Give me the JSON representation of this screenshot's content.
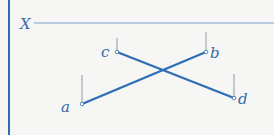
{
  "diagram": {
    "axis_label": "X",
    "points": [
      {
        "label": "a",
        "x": 82,
        "y": 104,
        "tick_top": 75
      },
      {
        "label": "b",
        "x": 206,
        "y": 52,
        "tick_top": 32
      },
      {
        "label": "c",
        "x": 117,
        "y": 52,
        "tick_top": 38
      },
      {
        "label": "d",
        "x": 234,
        "y": 98,
        "tick_top": 74
      }
    ],
    "segments": [
      [
        "a",
        "b"
      ],
      [
        "c",
        "d"
      ]
    ],
    "colors": {
      "line": "#2f6db5",
      "axis": "#7aa0d0",
      "tick": "#8a9aaa",
      "label": "#3a6aa8",
      "border": "#2f6db5"
    }
  }
}
